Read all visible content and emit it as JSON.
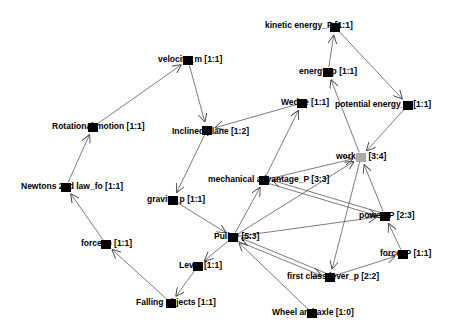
{
  "graph": {
    "nodes": [
      {
        "id": "kinetic",
        "label": "kinetic energy_P [1:1]",
        "x": 335,
        "y": 27,
        "lx": -70,
        "ly": -2,
        "color": "#000000"
      },
      {
        "id": "energy",
        "label": "energy_p [1:1]",
        "x": 328,
        "y": 72,
        "lx": -29,
        "ly": -1,
        "color": "#000000"
      },
      {
        "id": "potential",
        "label": "potential energy_P [1:1]",
        "x": 408,
        "y": 105,
        "lx": -73,
        "ly": -1,
        "color": "#000000"
      },
      {
        "id": "wedge",
        "label": "Wedge [1:1]",
        "x": 302,
        "y": 103,
        "lx": -21,
        "ly": -1,
        "color": "#000000"
      },
      {
        "id": "velocity",
        "label": "velocity_m [1:1]",
        "x": 188,
        "y": 60,
        "lx": -30,
        "ly": -1,
        "color": "#000000"
      },
      {
        "id": "rotational",
        "label": "Rotational motion [1:1]",
        "x": 93,
        "y": 127,
        "lx": -41,
        "ly": -1,
        "color": "#000000"
      },
      {
        "id": "inclined",
        "label": "Inclined plane [1:2]",
        "x": 207,
        "y": 130,
        "lx": -35,
        "ly": 1,
        "color": "#000000"
      },
      {
        "id": "work",
        "label": "work_P [3:4]",
        "x": 361,
        "y": 157,
        "lx": -25,
        "ly": -1,
        "color": "#aaaaaa"
      },
      {
        "id": "mechanical",
        "label": "mechanical advantage_P [3:3]",
        "x": 264,
        "y": 180,
        "lx": -56,
        "ly": -1,
        "color": "#000000"
      },
      {
        "id": "newtons",
        "label": "Newtons 2nd law_fo [1:1]",
        "x": 66,
        "y": 187,
        "lx": -45,
        "ly": -1,
        "color": "#000000"
      },
      {
        "id": "gravity",
        "label": "gravity_p [1:1]",
        "x": 173,
        "y": 200,
        "lx": -26,
        "ly": -1,
        "color": "#000000"
      },
      {
        "id": "power",
        "label": "power_P [2:3]",
        "x": 385,
        "y": 216,
        "lx": -26,
        "ly": -1,
        "color": "#000000"
      },
      {
        "id": "pulley",
        "label": "Pulley [5:3]",
        "x": 233,
        "y": 237,
        "lx": -19,
        "ly": -1,
        "color": "#000000"
      },
      {
        "id": "forcep",
        "label": "force_p [1:1]",
        "x": 106,
        "y": 244,
        "lx": -25,
        "ly": -1,
        "color": "#000000"
      },
      {
        "id": "forceP",
        "label": "force_P [1:1]",
        "x": 403,
        "y": 254,
        "lx": -23,
        "ly": -1,
        "color": "#000000"
      },
      {
        "id": "lever",
        "label": "Lever [1:1]",
        "x": 198,
        "y": 266,
        "lx": -19,
        "ly": -1,
        "color": "#000000"
      },
      {
        "id": "firstclass",
        "label": "first class lever_p [2:2]",
        "x": 330,
        "y": 277,
        "lx": -43,
        "ly": -1,
        "color": "#000000"
      },
      {
        "id": "falling",
        "label": "Falling objects [1:1]",
        "x": 171,
        "y": 303,
        "lx": -35,
        "ly": -1,
        "color": "#000000"
      },
      {
        "id": "wheel",
        "label": "Wheel and axle [1:0]",
        "x": 312,
        "y": 313,
        "lx": -40,
        "ly": -1,
        "color": "#000000"
      }
    ],
    "edges": [
      {
        "from": "energy",
        "to": "kinetic"
      },
      {
        "from": "kinetic",
        "to": "potential"
      },
      {
        "from": "potential",
        "to": "work"
      },
      {
        "from": "work",
        "to": "energy"
      },
      {
        "from": "work",
        "to": "firstclass"
      },
      {
        "from": "velocity",
        "to": "inclined"
      },
      {
        "from": "rotational",
        "to": "velocity"
      },
      {
        "from": "newtons",
        "to": "rotational"
      },
      {
        "from": "forcep",
        "to": "newtons"
      },
      {
        "from": "falling",
        "to": "forcep"
      },
      {
        "from": "lever",
        "to": "falling"
      },
      {
        "from": "pulley",
        "to": "lever"
      },
      {
        "from": "gravity",
        "to": "pulley"
      },
      {
        "from": "inclined",
        "to": "gravity"
      },
      {
        "from": "wedge",
        "to": "inclined"
      },
      {
        "from": "mechanical",
        "to": "wedge"
      },
      {
        "from": "pulley",
        "to": "mechanical"
      },
      {
        "from": "mechanical",
        "to": "work"
      },
      {
        "from": "pulley",
        "to": "work"
      },
      {
        "from": "mechanical",
        "to": "power"
      },
      {
        "from": "power",
        "to": "mechanical"
      },
      {
        "from": "pulley",
        "to": "power"
      },
      {
        "from": "firstclass",
        "to": "pulley"
      },
      {
        "from": "pulley",
        "to": "firstclass"
      },
      {
        "from": "wheel",
        "to": "pulley"
      },
      {
        "from": "firstclass",
        "to": "forceP"
      },
      {
        "from": "forceP",
        "to": "power"
      },
      {
        "from": "power",
        "to": "work"
      }
    ]
  }
}
